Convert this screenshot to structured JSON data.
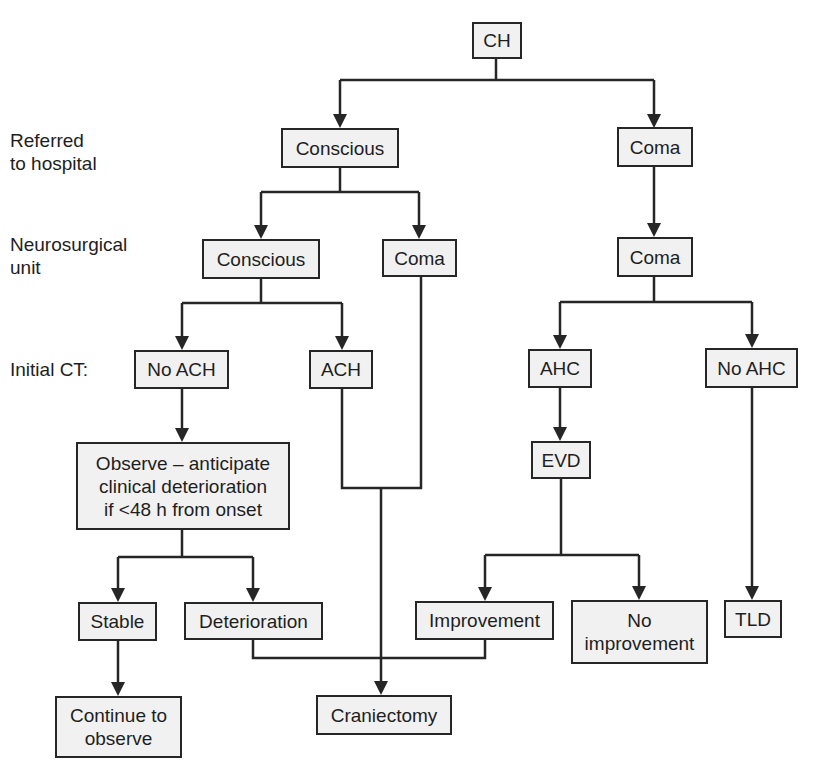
{
  "stage_labels": {
    "referred": "Referred\nto hospital",
    "neurosurgical": "Neurosurgical\nunit",
    "initial_ct": "Initial CT:"
  },
  "nodes": {
    "ch": "CH",
    "conscious_referred": "Conscious",
    "coma_referred": "Coma",
    "conscious_unit": "Conscious",
    "coma_unit_left": "Coma",
    "coma_unit_right": "Coma",
    "no_ach": "No ACH",
    "ach": "ACH",
    "ahc": "AHC",
    "no_ahc": "No AHC",
    "observe": "Observe – anticipate\nclinical deterioration\nif <48 h from onset",
    "evd": "EVD",
    "stable": "Stable",
    "deterioration": "Deterioration",
    "improvement": "Improvement",
    "no_improvement": "No\nimprovement",
    "tld": "TLD",
    "continue_observe": "Continue to\nobserve",
    "craniectomy": "Craniectomy"
  },
  "colors": {
    "line": "#262626",
    "node_fill": "#f1f1f1",
    "text": "#1e1e1e"
  }
}
